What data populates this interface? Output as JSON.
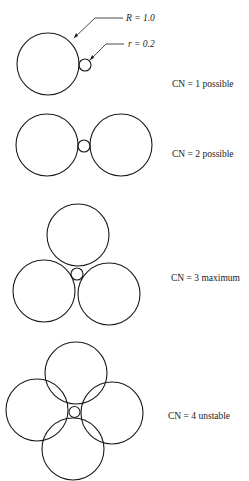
{
  "diagram": {
    "annotations": {
      "large_radius": "R = 1.0",
      "small_radius": "r = 0.2"
    },
    "rows": [
      {
        "label": "CN = 1 possible",
        "coordination_number": 1,
        "status": "possible"
      },
      {
        "label": "CN = 2 possible",
        "coordination_number": 2,
        "status": "possible"
      },
      {
        "label": "CN = 3 maximum",
        "coordination_number": 3,
        "status": "maximum"
      },
      {
        "label": "CN = 4 unstable",
        "coordination_number": 4,
        "status": "unstable"
      }
    ],
    "colors": {
      "stroke": "#1a1a1a",
      "background": "#ffffff"
    }
  }
}
